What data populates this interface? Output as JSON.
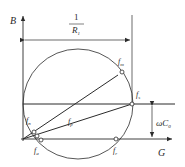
{
  "diagram": {
    "type": "admittance-circle",
    "axes": {
      "y_label": "B",
      "x_label": "G"
    },
    "dimensions": {
      "diameter_numerator": "1",
      "diameter_denominator": "R",
      "diameter_denominator_sub": "1",
      "offset_label": "ωC",
      "offset_label_sub": "0"
    },
    "points": [
      {
        "id": "fm",
        "label": "f",
        "sub": "m"
      },
      {
        "id": "fs",
        "label": "f",
        "sub": "s"
      },
      {
        "id": "fn",
        "label": "f",
        "sub": "n"
      },
      {
        "id": "fp",
        "label": "f",
        "sub": "p"
      },
      {
        "id": "fa",
        "label": "f",
        "sub": "a"
      },
      {
        "id": "fr",
        "label": "f",
        "sub": "r"
      }
    ],
    "colors": {
      "line": "#2b2b2b",
      "background": "#ffffff"
    }
  }
}
